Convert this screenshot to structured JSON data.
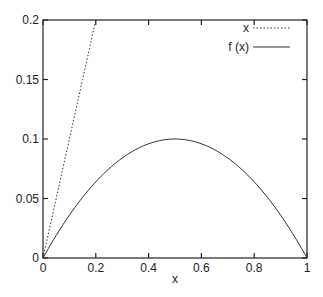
{
  "chart_data": {
    "type": "line",
    "title": "",
    "xlabel": "x",
    "ylabel": "",
    "xlim": [
      0,
      1
    ],
    "ylim": [
      0,
      0.2
    ],
    "grid": false,
    "legend_position": "top-right",
    "x_ticks": [
      0,
      0.2,
      0.4,
      0.6,
      0.8,
      1
    ],
    "x_tick_labels": [
      "0",
      "0.2",
      "0.4",
      "0.6",
      "0.8",
      "1"
    ],
    "y_ticks": [
      0,
      0.05,
      0.1,
      0.15,
      0.2
    ],
    "y_tick_labels": [
      "0",
      "0.05",
      "0.1",
      "0.15",
      "0.2"
    ],
    "series": [
      {
        "name": "x",
        "style": "dotted",
        "x": [
          0,
          0.05,
          0.1,
          0.15,
          0.2
        ],
        "values": [
          0,
          0.05,
          0.1,
          0.15,
          0.2
        ]
      },
      {
        "name": "f (x)",
        "style": "solid",
        "x": [
          0,
          0.1,
          0.2,
          0.3,
          0.4,
          0.5,
          0.6,
          0.7,
          0.8,
          0.9,
          1.0
        ],
        "values": [
          0,
          0.036,
          0.064,
          0.084,
          0.096,
          0.1,
          0.096,
          0.084,
          0.064,
          0.036,
          0
        ]
      }
    ]
  }
}
